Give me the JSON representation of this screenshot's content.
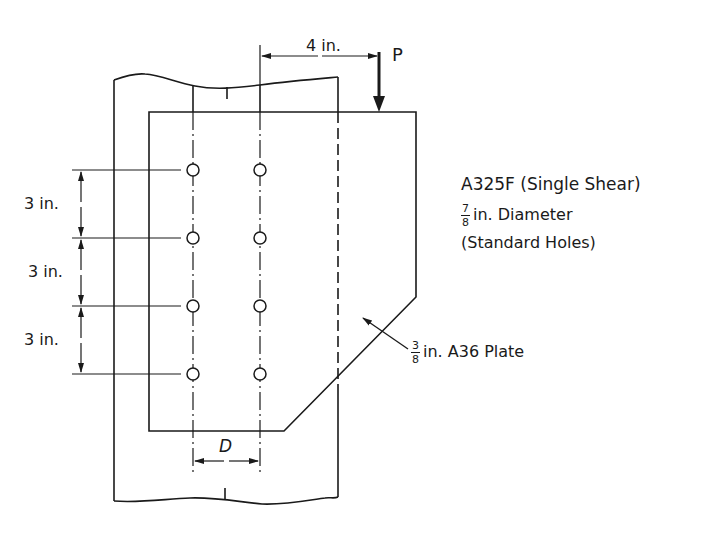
{
  "figure": {
    "type": "bolted-bracket-connection-drawing",
    "colors": {
      "line": "#1a1a1a",
      "background": "#ffffff"
    }
  },
  "dimensions": {
    "load_offset": "4 in.",
    "load_label": "P",
    "bolt_spacing": [
      "3 in.",
      "3 in.",
      "3 in."
    ],
    "gauge_label": "D"
  },
  "notes": {
    "bolt_spec": "A325F (Single Shear)",
    "hole_fraction_num": "7",
    "hole_fraction_den": "8",
    "hole_text": "in. Diameter",
    "hole_type": "(Standard Holes)",
    "plate_fraction_num": "3",
    "plate_fraction_den": "8",
    "plate_text": "in. A36 Plate"
  },
  "bolts": {
    "columns": 2,
    "rows": 4
  }
}
